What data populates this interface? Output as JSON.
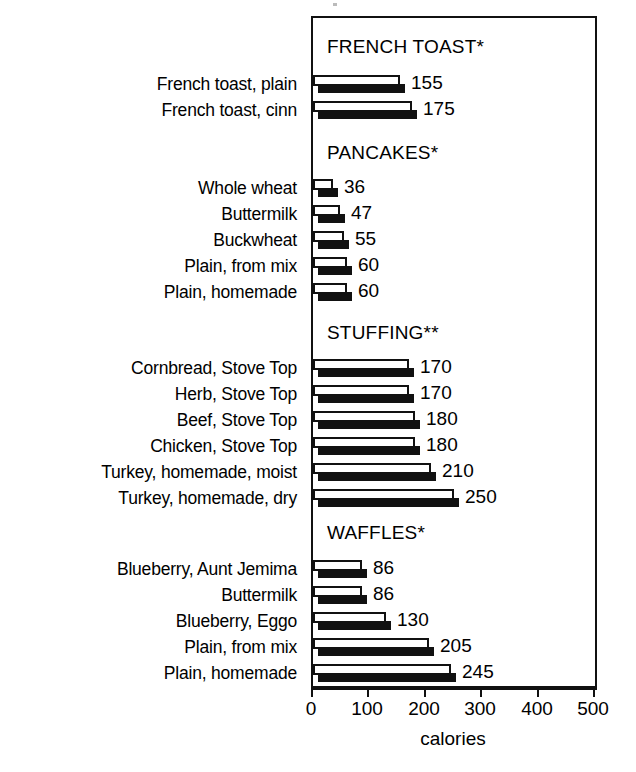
{
  "chart_data": {
    "type": "bar",
    "orientation": "horizontal",
    "title": "",
    "xlabel": "calories",
    "ylabel": "",
    "xlim": [
      0,
      500
    ],
    "xticks": [
      0,
      100,
      200,
      300,
      400,
      500
    ],
    "xtick_labels": [
      "0",
      "100",
      "200",
      "300",
      "400",
      "500"
    ],
    "grid": false,
    "legend": false,
    "style": "3d-horizontal-bars-white-face-black-shadow",
    "groups": [
      {
        "heading": "FRENCH TOAST*",
        "categories": [
          "French toast, plain",
          "French toast, cinn"
        ],
        "values": [
          155,
          175
        ]
      },
      {
        "heading": "PANCAKES*",
        "categories": [
          "Whole wheat",
          "Buttermilk",
          "Buckwheat",
          "Plain, from mix",
          "Plain, homemade"
        ],
        "values": [
          36,
          47,
          55,
          60,
          60
        ]
      },
      {
        "heading": "STUFFING**",
        "categories": [
          "Cornbread, Stove Top",
          "Herb, Stove Top",
          "Beef, Stove Top",
          "Chicken, Stove Top",
          "Turkey, homemade, moist",
          "Turkey, homemade, dry"
        ],
        "values": [
          170,
          170,
          180,
          180,
          210,
          250
        ]
      },
      {
        "heading": "WAFFLES*",
        "categories": [
          "Blueberry, Aunt Jemima",
          "Buttermilk",
          "Blueberry, Eggo",
          "Plain, from mix",
          "Plain, homemade"
        ],
        "values": [
          86,
          86,
          130,
          205,
          245
        ]
      }
    ],
    "categories": [
      "French toast, plain",
      "French toast, cinn",
      "Whole wheat",
      "Buttermilk",
      "Buckwheat",
      "Plain, from mix",
      "Plain, homemade",
      "Cornbread, Stove Top",
      "Herb, Stove Top",
      "Beef, Stove Top",
      "Chicken, Stove Top",
      "Turkey, homemade, moist",
      "Turkey, homemade, dry",
      "Blueberry, Aunt Jemima",
      "Buttermilk",
      "Blueberry, Eggo",
      "Plain, from mix",
      "Plain, homemade"
    ],
    "values": [
      155,
      175,
      36,
      47,
      55,
      60,
      60,
      170,
      170,
      180,
      180,
      210,
      250,
      86,
      86,
      130,
      205,
      245
    ],
    "colors": {
      "bar_face": "#ffffff",
      "bar_edge": "#111111",
      "bar_shadow": "#111111",
      "axis": "#111111",
      "text": "#000000",
      "background": "#ffffff"
    }
  },
  "rows": [
    {
      "label": "French toast, plain",
      "value": 155,
      "value_text": "155",
      "y": 72
    },
    {
      "label": "French toast, cinn",
      "value": 175,
      "value_text": "175",
      "y": 98
    },
    {
      "label": "Whole wheat",
      "value": 36,
      "value_text": "36",
      "y": 176
    },
    {
      "label": "Buttermilk",
      "value": 47,
      "value_text": "47",
      "y": 202
    },
    {
      "label": "Buckwheat",
      "value": 55,
      "value_text": "55",
      "y": 228
    },
    {
      "label": "Plain, from mix",
      "value": 60,
      "value_text": "60",
      "y": 254
    },
    {
      "label": "Plain, homemade",
      "value": 60,
      "value_text": "60",
      "y": 280
    },
    {
      "label": "Cornbread, Stove Top",
      "value": 170,
      "value_text": "170",
      "y": 356
    },
    {
      "label": "Herb, Stove Top",
      "value": 170,
      "value_text": "170",
      "y": 382
    },
    {
      "label": "Beef, Stove Top",
      "value": 180,
      "value_text": "180",
      "y": 408
    },
    {
      "label": "Chicken, Stove Top",
      "value": 180,
      "value_text": "180",
      "y": 434
    },
    {
      "label": "Turkey, homemade, moist",
      "value": 210,
      "value_text": "210",
      "y": 460
    },
    {
      "label": "Turkey, homemade, dry",
      "value": 250,
      "value_text": "250",
      "y": 486
    },
    {
      "label": "Blueberry, Aunt Jemima",
      "value": 86,
      "value_text": "86",
      "y": 557
    },
    {
      "label": "Buttermilk",
      "value": 86,
      "value_text": "86",
      "y": 583
    },
    {
      "label": "Blueberry, Eggo",
      "value": 130,
      "value_text": "130",
      "y": 609
    },
    {
      "label": "Plain, from mix",
      "value": 205,
      "value_text": "205",
      "y": 635
    },
    {
      "label": "Plain, homemade",
      "value": 245,
      "value_text": "245",
      "y": 661
    }
  ],
  "section_headings": [
    {
      "text": "FRENCH TOAST*",
      "y": 36
    },
    {
      "text": "PANCAKES*",
      "y": 142
    },
    {
      "text": "STUFFING**",
      "y": 322
    },
    {
      "text": "WAFFLES*",
      "y": 522
    }
  ],
  "axis": {
    "title": "calories",
    "ticks": [
      {
        "label": "0",
        "value": 0
      },
      {
        "label": "100",
        "value": 100
      },
      {
        "label": "200",
        "value": 200
      },
      {
        "label": "300",
        "value": 300
      },
      {
        "label": "400",
        "value": 400
      },
      {
        "label": "500",
        "value": 500
      }
    ]
  }
}
